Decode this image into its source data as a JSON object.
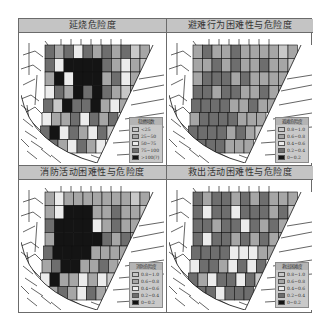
{
  "figure": {
    "panels": [
      {
        "id": "fire-spread",
        "title": "延烧危险度",
        "legend": {
          "title": "稳燃倾数",
          "items": [
            {
              "label": "<25",
              "color": "#c8c8c8"
            },
            {
              "label": "25~50",
              "color": "#a6a6a6"
            },
            {
              "label": "50~75",
              "color": "#ececec"
            },
            {
              "label": "75~100",
              "color": "#6e6e6e"
            },
            {
              "label": ">100(?)",
              "color": "#141414"
            }
          ]
        }
      },
      {
        "id": "evacuation",
        "title": "避难行为困难性与危险度",
        "legend": {
          "title": "避难危险度",
          "items": [
            {
              "label": "0.8~1.0",
              "color": "#c8c8c8"
            },
            {
              "label": "0.6~0.8",
              "color": "#a6a6a6"
            },
            {
              "label": "0.4~0.6",
              "color": "#ececec"
            },
            {
              "label": "0.2~0.4",
              "color": "#6e6e6e"
            },
            {
              "label": "0~0.2",
              "color": "#141414"
            }
          ]
        }
      },
      {
        "id": "firefighting",
        "title": "消防活动困难性与危险度",
        "legend": {
          "title": "消防危险度",
          "items": [
            {
              "label": "0.8~1.0",
              "color": "#c8c8c8"
            },
            {
              "label": "0.6~0.8",
              "color": "#a6a6a6"
            },
            {
              "label": "0.4~0.6",
              "color": "#ececec"
            },
            {
              "label": "0.2~0.4",
              "color": "#6e6e6e"
            },
            {
              "label": "0~0.2",
              "color": "#141414"
            }
          ]
        }
      },
      {
        "id": "rescue",
        "title": "救出活动困难性与危险度",
        "legend": {
          "title": "救出困难度",
          "items": [
            {
              "label": "0.8~1.0",
              "color": "#c8c8c8"
            },
            {
              "label": "0.6~0.8",
              "color": "#a6a6a6"
            },
            {
              "label": "0.4~0.6",
              "color": "#ececec"
            },
            {
              "label": "0.2~0.4",
              "color": "#6e6e6e"
            },
            {
              "label": "0~0.2",
              "color": "#141414"
            }
          ]
        }
      }
    ],
    "palette": [
      "#c8c8c8",
      "#a6a6a6",
      "#ececec",
      "#6e6e6e",
      "#141414"
    ],
    "block_classes": [
      [
        [
          3,
          1,
          3,
          2,
          3,
          1,
          3,
          1,
          3,
          0,
          1
        ],
        [
          3,
          2,
          4,
          4,
          4,
          4,
          3,
          1,
          2,
          1,
          0
        ],
        [
          1,
          4,
          2,
          4,
          4,
          4,
          1,
          3,
          2,
          1,
          0
        ],
        [
          2,
          3,
          1,
          4,
          3,
          4,
          3,
          1,
          0,
          1,
          -1
        ],
        [
          3,
          0,
          4,
          3,
          3,
          4,
          1,
          2,
          1,
          -1,
          -1
        ],
        [
          2,
          1,
          1,
          3,
          2,
          3,
          1,
          3,
          -1,
          -1,
          -1
        ],
        [
          3,
          4,
          2,
          3,
          1,
          2,
          3,
          0,
          -1,
          -1,
          -1
        ],
        [
          -1,
          3,
          1,
          2,
          3,
          1,
          2,
          -1,
          -1,
          -1,
          -1
        ]
      ],
      [
        [
          1,
          3,
          1,
          1,
          3,
          1,
          1,
          1,
          1,
          0,
          1
        ],
        [
          1,
          1,
          3,
          1,
          3,
          1,
          1,
          3,
          1,
          1,
          0
        ],
        [
          1,
          3,
          3,
          3,
          1,
          3,
          1,
          1,
          1,
          1,
          0
        ],
        [
          3,
          3,
          1,
          3,
          3,
          1,
          1,
          3,
          1,
          1,
          -1
        ],
        [
          3,
          3,
          3,
          3,
          1,
          1,
          3,
          1,
          1,
          -1,
          -1
        ],
        [
          1,
          3,
          3,
          3,
          3,
          1,
          1,
          1,
          -1,
          -1,
          -1
        ],
        [
          3,
          3,
          3,
          3,
          1,
          3,
          1,
          0,
          -1,
          -1,
          -1
        ],
        [
          -1,
          3,
          3,
          3,
          1,
          1,
          1,
          -1,
          -1,
          -1,
          -1
        ]
      ],
      [
        [
          1,
          2,
          1,
          1,
          1,
          1,
          1,
          1,
          1,
          0,
          1
        ],
        [
          1,
          2,
          4,
          4,
          4,
          1,
          1,
          3,
          1,
          1,
          0
        ],
        [
          3,
          4,
          4,
          4,
          4,
          2,
          1,
          3,
          1,
          1,
          0
        ],
        [
          1,
          4,
          4,
          4,
          4,
          4,
          3,
          1,
          3,
          1,
          -1
        ],
        [
          3,
          4,
          4,
          4,
          4,
          1,
          1,
          1,
          1,
          -1,
          -1
        ],
        [
          1,
          3,
          4,
          4,
          1,
          1,
          3,
          1,
          -1,
          -1,
          -1
        ],
        [
          2,
          4,
          1,
          1,
          2,
          1,
          2,
          0,
          -1,
          -1,
          -1
        ],
        [
          -1,
          1,
          3,
          1,
          2,
          3,
          1,
          -1,
          -1,
          -1,
          -1
        ]
      ],
      [
        [
          3,
          1,
          3,
          3,
          1,
          3,
          1,
          3,
          1,
          1,
          1
        ],
        [
          3,
          2,
          3,
          3,
          2,
          3,
          3,
          3,
          1,
          3,
          0
        ],
        [
          3,
          3,
          1,
          3,
          3,
          2,
          3,
          1,
          3,
          1,
          0
        ],
        [
          3,
          2,
          3,
          3,
          1,
          3,
          1,
          3,
          1,
          1,
          -1
        ],
        [
          3,
          3,
          3,
          3,
          2,
          2,
          2,
          1,
          1,
          -1,
          -1
        ],
        [
          2,
          3,
          3,
          1,
          2,
          3,
          2,
          3,
          -1,
          -1,
          -1
        ],
        [
          3,
          1,
          2,
          3,
          3,
          2,
          3,
          0,
          -1,
          -1,
          -1
        ],
        [
          -1,
          3,
          3,
          2,
          3,
          3,
          3,
          -1,
          -1,
          -1,
          -1
        ]
      ]
    ]
  }
}
